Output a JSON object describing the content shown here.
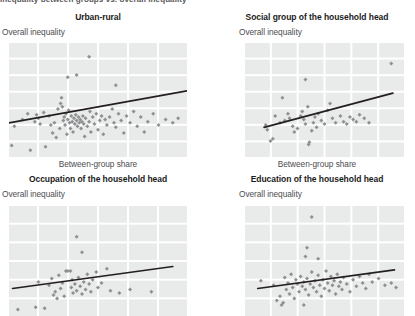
{
  "figure": {
    "cut_header_text": "Inequality between groups vs. overall inequality",
    "grid_color": "#e9eaea",
    "point_color": "#8e9092",
    "trendline_color": "#231f20",
    "title_color": "#1b1b1b",
    "label_color": "#4d4d4f",
    "background": "#ffffff"
  },
  "panels": [
    {
      "id": "urban-rural",
      "title": "Urban-rural",
      "ylabel": "Overall inequality",
      "xlabel": "Between-group share",
      "show_xlabel": true
    },
    {
      "id": "social-group",
      "title": "Social group of the household head",
      "ylabel": "Overall inequality",
      "xlabel": "Between-group share",
      "show_xlabel": true
    },
    {
      "id": "occupation",
      "title": "Occupation of the household head",
      "ylabel": "Overall inequality",
      "xlabel": "Between-group share",
      "show_xlabel": false
    },
    {
      "id": "education",
      "title": "Education of the household head",
      "ylabel": "Overall inequality",
      "xlabel": "Between-group share",
      "show_xlabel": false
    }
  ],
  "chart_data": [
    {
      "type": "scatter",
      "title": "Urban-rural",
      "xlabel": "Between-group share",
      "ylabel": "Overall inequality",
      "xlim": [
        0,
        100
      ],
      "ylim": [
        0,
        100
      ],
      "grid": true,
      "grid_cols": 6,
      "grid_rows": 7,
      "legend": "none",
      "trendline": {
        "x0": 0,
        "y0": 30,
        "x1": 100,
        "y1": 58
      },
      "points": [
        [
          1.5,
          10
        ],
        [
          3.0,
          27
        ],
        [
          7.5,
          33
        ],
        [
          10.5,
          38
        ],
        [
          12.0,
          6
        ],
        [
          14.5,
          31
        ],
        [
          15.5,
          37
        ],
        [
          16.5,
          34
        ],
        [
          17.5,
          29
        ],
        [
          19.5,
          39
        ],
        [
          20.5,
          9
        ],
        [
          22.5,
          36
        ],
        [
          23.5,
          28
        ],
        [
          24.5,
          21
        ],
        [
          25.5,
          30
        ],
        [
          26.5,
          17
        ],
        [
          27.5,
          42
        ],
        [
          28.5,
          25
        ],
        [
          29.0,
          47
        ],
        [
          29.5,
          52
        ],
        [
          30.0,
          44
        ],
        [
          30.5,
          32
        ],
        [
          31.0,
          35
        ],
        [
          31.5,
          28
        ],
        [
          32.0,
          38
        ],
        [
          32.5,
          20
        ],
        [
          33.0,
          33
        ],
        [
          33.5,
          41
        ],
        [
          34.0,
          30
        ],
        [
          34.5,
          25
        ],
        [
          35.0,
          36
        ],
        [
          35.5,
          31
        ],
        [
          36.0,
          22
        ],
        [
          36.5,
          34
        ],
        [
          37.0,
          29
        ],
        [
          37.5,
          37
        ],
        [
          38.0,
          32
        ],
        [
          38.5,
          27
        ],
        [
          39.0,
          35
        ],
        [
          39.5,
          30
        ],
        [
          40.0,
          33
        ],
        [
          40.5,
          25
        ],
        [
          41.0,
          31
        ],
        [
          41.5,
          36
        ],
        [
          42.0,
          29
        ],
        [
          42.5,
          18
        ],
        [
          43.0,
          34
        ],
        [
          44.0,
          27
        ],
        [
          45.0,
          31
        ],
        [
          45.5,
          40
        ],
        [
          46.0,
          22
        ],
        [
          47.0,
          35
        ],
        [
          48.0,
          29
        ],
        [
          49.0,
          38
        ],
        [
          50.0,
          24
        ],
        [
          51.0,
          32
        ],
        [
          52.0,
          36
        ],
        [
          53.0,
          20
        ],
        [
          54.0,
          33
        ],
        [
          55.0,
          28
        ],
        [
          56.5,
          35
        ],
        [
          58.0,
          42
        ],
        [
          59.0,
          30
        ],
        [
          60.0,
          26
        ],
        [
          61.5,
          38
        ],
        [
          63.0,
          32
        ],
        [
          64.5,
          21
        ],
        [
          66.0,
          36
        ],
        [
          68.0,
          30
        ],
        [
          70.0,
          40
        ],
        [
          72.0,
          27
        ],
        [
          74.0,
          35
        ],
        [
          76.0,
          22
        ],
        [
          78.0,
          31
        ],
        [
          81.0,
          38
        ],
        [
          84.0,
          28
        ],
        [
          88.0,
          33
        ],
        [
          92.0,
          30
        ],
        [
          95.0,
          34
        ],
        [
          45.0,
          88
        ],
        [
          38.0,
          72
        ],
        [
          60.0,
          63
        ],
        [
          33.0,
          70
        ]
      ]
    },
    {
      "type": "scatter",
      "title": "Social group of the household head",
      "xlabel": "Between-group share",
      "ylabel": "Overall inequality",
      "xlim": [
        0,
        100
      ],
      "ylim": [
        0,
        100
      ],
      "grid": true,
      "grid_cols": 6,
      "grid_rows": 7,
      "legend": "none",
      "trendline": {
        "x0": 12,
        "y0": 26,
        "x1": 93,
        "y1": 56
      },
      "points": [
        [
          13.0,
          28
        ],
        [
          14.0,
          24
        ],
        [
          16.0,
          14
        ],
        [
          17.5,
          16
        ],
        [
          19.0,
          36
        ],
        [
          22.0,
          30
        ],
        [
          23.5,
          52
        ],
        [
          25.0,
          32
        ],
        [
          27.0,
          38
        ],
        [
          28.0,
          34
        ],
        [
          30.0,
          27
        ],
        [
          31.0,
          22
        ],
        [
          33.0,
          25
        ],
        [
          35.0,
          36
        ],
        [
          36.0,
          40
        ],
        [
          37.0,
          33
        ],
        [
          38.0,
          29
        ],
        [
          39.5,
          44
        ],
        [
          40.0,
          11
        ],
        [
          40.5,
          13
        ],
        [
          42.0,
          23
        ],
        [
          43.0,
          30
        ],
        [
          44.0,
          35
        ],
        [
          45.0,
          26
        ],
        [
          46.0,
          38
        ],
        [
          48.0,
          32
        ],
        [
          50.0,
          29
        ],
        [
          52.0,
          41
        ],
        [
          53.5,
          47
        ],
        [
          55.0,
          34
        ],
        [
          57.0,
          30
        ],
        [
          60.0,
          36
        ],
        [
          62.0,
          31
        ],
        [
          64.0,
          29
        ],
        [
          66.0,
          35
        ],
        [
          68.0,
          33
        ],
        [
          70.0,
          31
        ],
        [
          72.0,
          37
        ],
        [
          75.0,
          34
        ],
        [
          78.0,
          30
        ],
        [
          38.0,
          68
        ],
        [
          92.0,
          82
        ]
      ]
    },
    {
      "type": "scatter",
      "title": "Occupation of the household head",
      "xlabel": "Between-group share",
      "ylabel": "Overall inequality",
      "xlim": [
        0,
        100
      ],
      "ylim": [
        0,
        100
      ],
      "grid": true,
      "grid_cols": 6,
      "grid_rows": 6,
      "legend": "none",
      "trendline": {
        "x0": 2,
        "y0": 25,
        "x1": 92,
        "y1": 45
      },
      "points": [
        [
          5.0,
          6
        ],
        [
          15.0,
          8
        ],
        [
          16.5,
          31
        ],
        [
          20.0,
          7
        ],
        [
          22.5,
          28
        ],
        [
          24.0,
          34
        ],
        [
          25.0,
          19
        ],
        [
          26.0,
          22
        ],
        [
          27.0,
          16
        ],
        [
          28.0,
          37
        ],
        [
          29.0,
          25
        ],
        [
          30.0,
          30
        ],
        [
          31.0,
          18
        ],
        [
          32.0,
          41
        ],
        [
          33.0,
          41
        ],
        [
          34.5,
          41
        ],
        [
          35.0,
          26
        ],
        [
          35.5,
          33
        ],
        [
          36.0,
          21
        ],
        [
          37.0,
          29
        ],
        [
          38.0,
          23
        ],
        [
          39.0,
          35
        ],
        [
          40.0,
          27
        ],
        [
          41.0,
          20
        ],
        [
          42.0,
          31
        ],
        [
          43.0,
          24
        ],
        [
          44.0,
          38
        ],
        [
          45.0,
          29
        ],
        [
          46.0,
          22
        ],
        [
          47.0,
          33
        ],
        [
          49.0,
          40
        ],
        [
          50.0,
          26
        ],
        [
          52.0,
          30
        ],
        [
          55.0,
          43
        ],
        [
          57.0,
          23
        ],
        [
          62.0,
          21
        ],
        [
          68.0,
          24
        ],
        [
          80.0,
          22
        ],
        [
          38.0,
          72
        ],
        [
          41.0,
          58
        ]
      ]
    },
    {
      "type": "scatter",
      "title": "Education of the household head",
      "xlabel": "Between-group share",
      "ylabel": "Overall inequality",
      "xlim": [
        0,
        100
      ],
      "ylim": [
        0,
        100
      ],
      "grid": true,
      "grid_cols": 6,
      "grid_rows": 6,
      "legend": "none",
      "trendline": {
        "x0": 8,
        "y0": 25,
        "x1": 94,
        "y1": 42
      },
      "points": [
        [
          10.0,
          32
        ],
        [
          18.0,
          28
        ],
        [
          20.0,
          14
        ],
        [
          22.0,
          18
        ],
        [
          23.0,
          10
        ],
        [
          24.0,
          12
        ],
        [
          25.0,
          35
        ],
        [
          26.0,
          24
        ],
        [
          27.0,
          30
        ],
        [
          28.0,
          20
        ],
        [
          29.0,
          38
        ],
        [
          30.0,
          26
        ],
        [
          31.0,
          16
        ],
        [
          32.0,
          33
        ],
        [
          33.0,
          29
        ],
        [
          34.0,
          22
        ],
        [
          35.0,
          36
        ],
        [
          36.0,
          27
        ],
        [
          37.0,
          31
        ],
        [
          38.0,
          24
        ],
        [
          39.0,
          34
        ],
        [
          40.0,
          19
        ],
        [
          41.0,
          29
        ],
        [
          42.0,
          40
        ],
        [
          43.0,
          26
        ],
        [
          44.0,
          32
        ],
        [
          45.0,
          22
        ],
        [
          46.0,
          37
        ],
        [
          47.0,
          28
        ],
        [
          48.0,
          18
        ],
        [
          49.0,
          33
        ],
        [
          50.0,
          25
        ],
        [
          51.0,
          41
        ],
        [
          52.0,
          30
        ],
        [
          53.0,
          23
        ],
        [
          54.0,
          36
        ],
        [
          55.0,
          28
        ],
        [
          56.0,
          32
        ],
        [
          57.0,
          20
        ],
        [
          58.0,
          38
        ],
        [
          59.0,
          27
        ],
        [
          60.0,
          31
        ],
        [
          61.0,
          24
        ],
        [
          62.0,
          35
        ],
        [
          64.0,
          29
        ],
        [
          66.0,
          22
        ],
        [
          68.0,
          33
        ],
        [
          70.0,
          27
        ],
        [
          72.0,
          36
        ],
        [
          74.0,
          30
        ],
        [
          76.0,
          25
        ],
        [
          78.0,
          38
        ],
        [
          80.0,
          31
        ],
        [
          84.0,
          34
        ],
        [
          88.0,
          28
        ],
        [
          92.0,
          30
        ],
        [
          95.0,
          26
        ],
        [
          38.0,
          54
        ],
        [
          39.0,
          62
        ],
        [
          42.0,
          90
        ],
        [
          46.0,
          52
        ],
        [
          37.0,
          10
        ]
      ]
    }
  ]
}
